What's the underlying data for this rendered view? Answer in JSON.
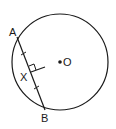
{
  "diagram": {
    "points": {
      "A": {
        "label": "A",
        "x": 17,
        "y": 37
      },
      "B": {
        "label": "B",
        "x": 45,
        "y": 110
      },
      "X": {
        "label": "X",
        "x": 31,
        "y": 73
      },
      "O": {
        "label": "O",
        "x": 60,
        "y": 62
      }
    },
    "circle": {
      "cx": 60,
      "cy": 62,
      "r": 48
    },
    "annotations": {
      "equal_segments": [
        "AX",
        "XB"
      ],
      "right_angle_at": "X"
    },
    "colors": {
      "stroke": "#1a1a1a",
      "background": "#ffffff"
    }
  }
}
